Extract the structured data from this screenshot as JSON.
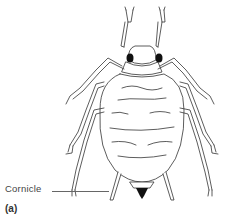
{
  "figure": {
    "labels": {
      "cornicle": "Cornicle",
      "panel": "(a)"
    },
    "colors": {
      "line": "#333333",
      "fill": "#ffffff",
      "dark": "#111111"
    }
  }
}
